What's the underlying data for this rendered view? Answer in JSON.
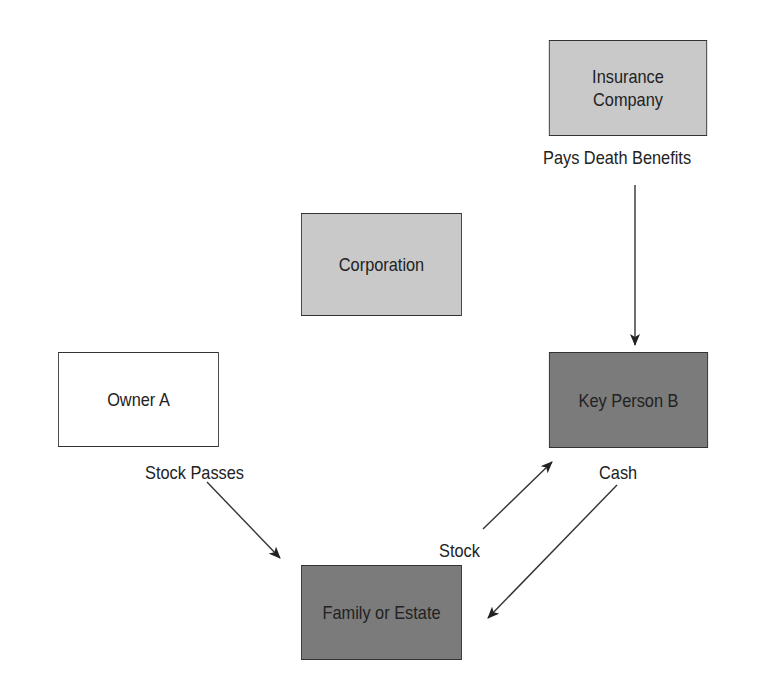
{
  "diagram": {
    "nodes": [
      {
        "id": "insurance",
        "label_line1": "Insurance",
        "label_line2": "Company",
        "fill": "#c9c9c9"
      },
      {
        "id": "corporation",
        "label": "Corporation",
        "fill": "#c9c9c9"
      },
      {
        "id": "owner_a",
        "label": "Owner A",
        "fill": "#ffffff"
      },
      {
        "id": "key_person_b",
        "label": "Key Person B",
        "fill": "#7b7b7b"
      },
      {
        "id": "family_estate",
        "label": "Family or Estate",
        "fill": "#7b7b7b"
      }
    ],
    "edges": [
      {
        "from": "insurance",
        "to": "key_person_b",
        "label": "Pays Death Benefits"
      },
      {
        "from": "owner_a",
        "to": "family_estate",
        "label": "Stock Passes"
      },
      {
        "from": "family_estate",
        "to": "key_person_b",
        "label": "Stock"
      },
      {
        "from": "key_person_b",
        "to": "family_estate",
        "label": "Cash"
      }
    ]
  }
}
